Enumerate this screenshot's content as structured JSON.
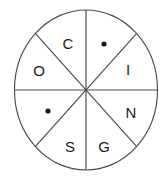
{
  "figure": {
    "title": "",
    "type": "circle-divided-into-eight-sectors",
    "shape": {
      "outline": "ellipse",
      "center_x": 86,
      "center_y": 90,
      "radius_x": 71,
      "radius_y": 80,
      "stroke_color": "#4a4a4a",
      "fill_color": "#ffffff"
    },
    "dividers": [
      {
        "name": "vertical-diameter",
        "angle_deg": 90
      },
      {
        "name": "horizontal-diameter",
        "angle_deg": 0
      },
      {
        "name": "diagonal-diameter-nw-se",
        "angle_deg": 45
      },
      {
        "name": "diagonal-diameter-ne-sw",
        "angle_deg": 135
      }
    ],
    "sectors": [
      {
        "position": "top-left-upper",
        "content_type": "letter",
        "label": "C",
        "x": 68,
        "y": 44
      },
      {
        "position": "top-right-upper",
        "content_type": "dot",
        "label": "•",
        "x": 104,
        "y": 44
      },
      {
        "position": "right-upper",
        "content_type": "letter",
        "label": "I",
        "x": 128,
        "y": 70
      },
      {
        "position": "right-lower",
        "content_type": "letter",
        "label": "N",
        "x": 131,
        "y": 113
      },
      {
        "position": "bottom-right-lower",
        "content_type": "letter",
        "label": "G",
        "x": 104,
        "y": 147
      },
      {
        "position": "bottom-left-lower",
        "content_type": "letter",
        "label": "S",
        "x": 70,
        "y": 147
      },
      {
        "position": "left-lower",
        "content_type": "dot",
        "label": "•",
        "x": 48,
        "y": 111
      },
      {
        "position": "left-upper",
        "content_type": "letter",
        "label": "O",
        "x": 39,
        "y": 71
      }
    ],
    "dot_radius": 2.6,
    "reading_clockwise": "C • I N G S • O"
  }
}
